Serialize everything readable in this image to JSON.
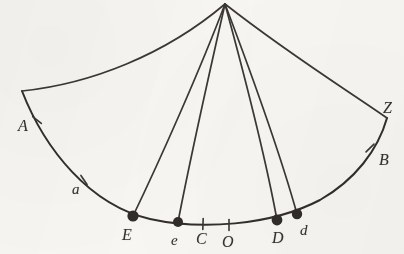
{
  "figure": {
    "background_color": "#f7f6f3",
    "ink_color": "#3a3734",
    "line_width": 1.6,
    "apex": {
      "x": 225,
      "y": 4,
      "name": "apex-vertex"
    },
    "labels": [
      {
        "id": "A",
        "text": "A",
        "x": 18,
        "y": 118,
        "case": "upper"
      },
      {
        "id": "a",
        "text": "a",
        "x": 72,
        "y": 182,
        "case": "lower"
      },
      {
        "id": "E",
        "text": "E",
        "x": 122,
        "y": 227,
        "case": "upper"
      },
      {
        "id": "e",
        "text": "e",
        "x": 171,
        "y": 233,
        "case": "lower"
      },
      {
        "id": "C",
        "text": "C",
        "x": 196,
        "y": 231,
        "case": "upper"
      },
      {
        "id": "O",
        "text": "O",
        "x": 222,
        "y": 234,
        "case": "upper"
      },
      {
        "id": "D",
        "text": "D",
        "x": 272,
        "y": 230,
        "case": "upper"
      },
      {
        "id": "d",
        "text": "d",
        "x": 300,
        "y": 223,
        "case": "lower"
      },
      {
        "id": "B",
        "text": "B",
        "x": 379,
        "y": 152,
        "case": "upper"
      },
      {
        "id": "Z",
        "text": "Z",
        "x": 383,
        "y": 100,
        "case": "upper"
      }
    ],
    "marked_points": [
      {
        "id": "E",
        "x": 133,
        "y": 216,
        "radius": 5.6,
        "style": "filled-dot"
      },
      {
        "id": "e",
        "x": 178,
        "y": 222,
        "radius": 5.0,
        "style": "filled-dot"
      },
      {
        "id": "D",
        "x": 277,
        "y": 220,
        "radius": 5.4,
        "style": "filled-dot"
      },
      {
        "id": "d",
        "x": 297,
        "y": 214,
        "radius": 5.2,
        "style": "filled-dot"
      }
    ],
    "tick_marks": [
      {
        "id": "A",
        "x": 37,
        "y": 120,
        "angle": -52
      },
      {
        "id": "a",
        "x": 84,
        "y": 180,
        "angle": -34
      },
      {
        "id": "C",
        "x": 203,
        "y": 224,
        "angle": 2
      },
      {
        "id": "O",
        "x": 229,
        "y": 225,
        "angle": 0
      },
      {
        "id": "B",
        "x": 370,
        "y": 148,
        "angle": 46
      }
    ],
    "paths": {
      "main_arc": "M 22 91 C 45 150, 90 205, 150 219 C 200 230, 270 226, 320 200 C 355 180, 378 150, 387 118",
      "outer_arc_left": "M 22 91 C 90 84, 165 55, 225 4",
      "outer_arc_right": "M 225 4 C 290 55, 350 92, 387 118",
      "ray_to_E": "M 225 4 C 200 70, 160 160, 133 216",
      "ray_to_e": "M 225 4 C 210 70, 190 160, 178 222",
      "ray_to_D": "M 225 4 C 243 70, 266 160, 277 220",
      "ray_to_d": "M 225 4 C 250 70, 282 160, 297 214"
    },
    "path_names": {
      "main_arc": "main-arc",
      "outer_arc_left": "outer-arc-left",
      "outer_arc_right": "outer-arc-right",
      "ray_to_E": "ray-apex-to-E",
      "ray_to_e": "ray-apex-to-e",
      "ray_to_D": "ray-apex-to-D",
      "ray_to_d": "ray-apex-to-d"
    }
  }
}
